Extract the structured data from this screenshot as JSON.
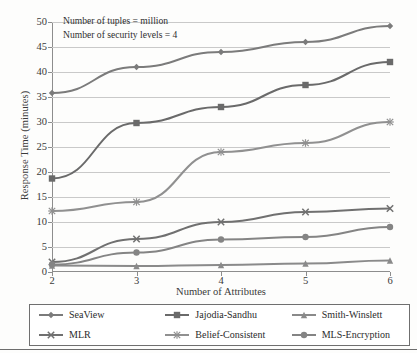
{
  "chart_data": {
    "type": "line",
    "title": "",
    "xlabel": "Number of Attributes",
    "ylabel": "Response Time (minutes)",
    "x": [
      2,
      3,
      4,
      5,
      6
    ],
    "xtick_labels": [
      "2",
      "3",
      "4",
      "5",
      "6"
    ],
    "ytick_labels": [
      "0",
      "5",
      "10",
      "15",
      "20",
      "25",
      "30",
      "35",
      "40",
      "45",
      "50"
    ],
    "yticks": [
      0,
      5,
      10,
      15,
      20,
      25,
      30,
      35,
      40,
      45,
      50
    ],
    "xlim": [
      2,
      6
    ],
    "ylim": [
      0,
      50
    ],
    "grid": "horizontal",
    "legend_position": "bottom",
    "annotations": [
      "Number of tuples = million",
      "Number of security levels = 4"
    ],
    "series": [
      {
        "name": "SeaView",
        "marker": "diamond",
        "color": "#7b7b7b",
        "values": [
          35.8,
          41.0,
          44.0,
          46.0,
          49.2
        ]
      },
      {
        "name": "Jajodia-Sandhu",
        "marker": "square",
        "color": "#6a6a6a",
        "values": [
          18.7,
          29.8,
          33.0,
          37.4,
          42.0
        ]
      },
      {
        "name": "Smith-Winslett",
        "marker": "triangle",
        "color": "#8a8a8a",
        "values": [
          1.3,
          1.2,
          1.4,
          1.7,
          2.3
        ]
      },
      {
        "name": "MLR",
        "marker": "x",
        "color": "#707070",
        "values": [
          2.0,
          6.6,
          10.0,
          12.0,
          12.7
        ]
      },
      {
        "name": "Belief-Consistent",
        "marker": "asterisk",
        "color": "#909090",
        "values": [
          12.2,
          14.0,
          24.0,
          25.8,
          30.0
        ]
      },
      {
        "name": "MLS-Encryption",
        "marker": "circle",
        "color": "#848484",
        "values": [
          1.5,
          3.9,
          6.5,
          7.0,
          9.0
        ]
      }
    ]
  },
  "legend": {
    "items": [
      {
        "label": "SeaView",
        "marker": "diamond-marker-icon"
      },
      {
        "label": "Jajodia-Sandhu",
        "marker": "square-marker-icon"
      },
      {
        "label": "Smith-Winslett",
        "marker": "triangle-marker-icon"
      },
      {
        "label": "MLR",
        "marker": "x-marker-icon"
      },
      {
        "label": "Belief-Consistent",
        "marker": "asterisk-marker-icon"
      },
      {
        "label": "MLS-Encryption",
        "marker": "circle-marker-icon"
      }
    ]
  },
  "colors": {
    "axis": "#8d8d8d",
    "grid": "#c9c9c9",
    "text": "#2b2b2b",
    "background": "#fdfdfc"
  }
}
